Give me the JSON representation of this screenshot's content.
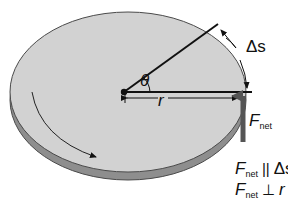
{
  "figure": {
    "colors": {
      "disc_top": "#d2d2d2",
      "disc_edge": "#8e8e8e",
      "outline": "#4a4a4a",
      "line": "#111111",
      "force_arrow": "#555555"
    },
    "labels": {
      "theta": "θ",
      "radius": "r",
      "arc_length": "Δs",
      "force": {
        "main": "F",
        "sub": "net"
      },
      "relation_parallel": {
        "main": "F",
        "sub": "net",
        "symbol": "||",
        "rhs": "Δs"
      },
      "relation_perpendicular": {
        "main": "F",
        "sub": "net",
        "symbol": "⊥",
        "rhs": "r"
      }
    }
  }
}
